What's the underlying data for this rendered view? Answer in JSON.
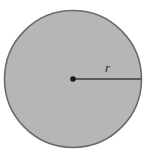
{
  "figure": {
    "name": "circle-with-radius-diagram",
    "background_color": "#ffffff",
    "width": 148,
    "height": 157
  },
  "circle": {
    "name": "shaded-circle",
    "center_x": 73,
    "center_y": 79,
    "radius": 68.5,
    "fill_color": "#b6b6b6",
    "stroke_color": "#6b6b6b",
    "stroke_width": 1.6
  },
  "center_point": {
    "name": "center-dot",
    "x": 73,
    "y": 79,
    "radius": 2.8,
    "color": "#1a1a1a"
  },
  "radius_segment": {
    "name": "radius-line",
    "x1": 73,
    "y1": 79,
    "x2": 141,
    "y2": 79,
    "color": "#3a3a3a",
    "stroke_width": 1.7
  },
  "radius_label": {
    "name": "radius-label",
    "text": "r",
    "x": 105,
    "y": 72,
    "style": "italic",
    "color": "#2b2b2b"
  }
}
